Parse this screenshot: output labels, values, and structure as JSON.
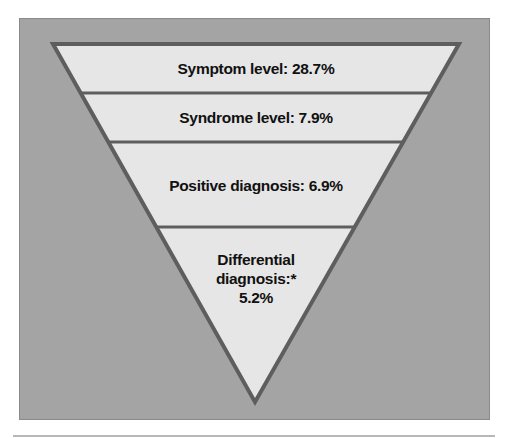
{
  "figure": {
    "levels": [
      {
        "label": "Symptom level: 28.7%"
      },
      {
        "label": "Syndrome level: 7.9%"
      },
      {
        "label": "Positive diagnosis: 6.9%"
      },
      {
        "label_line1": "Differential",
        "label_line2": "diagnosis:*",
        "label_line3": "5.2%"
      }
    ]
  },
  "colors": {
    "panel": "#a4a4a4",
    "funnel_fill": "#e6e6e6",
    "funnel_stroke": "#5e5e5e"
  }
}
